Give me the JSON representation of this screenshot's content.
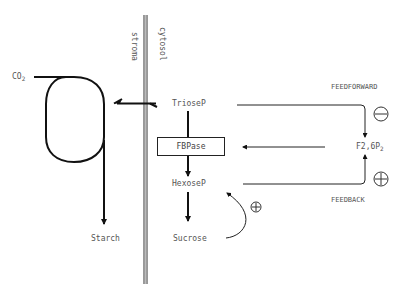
{
  "diagram": {
    "membrane": {
      "left_label": "stroma",
      "right_label": "cytosol"
    },
    "nodes": {
      "co2": "CO",
      "co2_sub": "2",
      "triosep": "TrioseP",
      "fbpase": "FBPase",
      "hexosep": "HexoseP",
      "starch": "Starch",
      "sucrose": "Sucrose",
      "f26p2": "F2,6P",
      "f26p2_sub": "2"
    },
    "regulation": {
      "feedforward_label": "FEEDFORWARD",
      "feedforward_sign": "−",
      "feedback_label": "FEEDBACK",
      "feedback_sign": "+",
      "sucrose_effect_sign": "+"
    },
    "edges": [
      {
        "from": "CO2",
        "to": "Calvin cycle"
      },
      {
        "from": "Calvin cycle",
        "to": "Starch"
      },
      {
        "from": "Calvin cycle",
        "to": "TrioseP",
        "bidirectional": true
      },
      {
        "from": "TrioseP",
        "to": "HexoseP",
        "via": "FBPase"
      },
      {
        "from": "HexoseP",
        "to": "Sucrose"
      },
      {
        "from": "TrioseP",
        "to": "F2,6P2",
        "label": "FEEDFORWARD",
        "sign": "−"
      },
      {
        "from": "HexoseP",
        "to": "F2,6P2",
        "label": "FEEDBACK",
        "sign": "+"
      },
      {
        "from": "F2,6P2",
        "to": "FBPase"
      },
      {
        "from": "Sucrose",
        "to": "HexoseP",
        "sign": "+"
      }
    ]
  }
}
